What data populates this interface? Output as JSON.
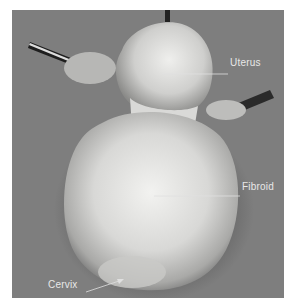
{
  "figure": {
    "background_color": "#7e7e7e",
    "labels": {
      "uterus": "Uterus",
      "fibroid": "Fibroid",
      "cervix": "Cervix"
    }
  }
}
